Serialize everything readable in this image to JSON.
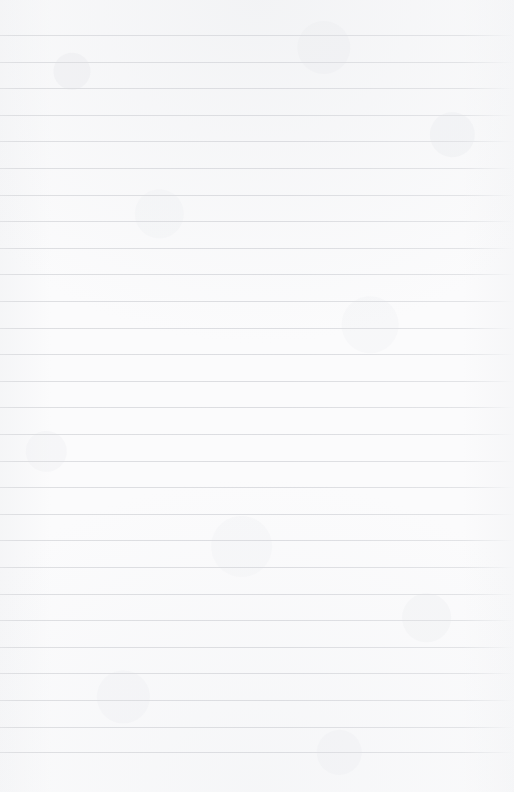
{
  "document": {
    "kind": "ruled-notebook-page",
    "title": "Blank ruled notebook page",
    "content_text": "",
    "written_text_present": "no",
    "page_width_px": 514,
    "page_height_px": 792
  },
  "paper": {
    "background_color": "#fbfbfc",
    "texture": "subtle mottled fibre grain",
    "margin_left_px": 0,
    "margin_right_px": 0,
    "top_margin_px": 35,
    "bottom_margin_px": 40
  },
  "ruling": {
    "style": "horizontal ruled lines",
    "line_color": "#dedfe2",
    "line_thickness_px": 1,
    "line_spacing_px": 26.6,
    "first_line_y_px": 35,
    "last_line_y_px": 752,
    "line_count": 28,
    "extends_full_width": "yes",
    "fades_at_right_edge": "yes",
    "vertical_margin_rule": "none",
    "line_positions_y": [
      35,
      61.6,
      88.2,
      114.8,
      141.4,
      168,
      194.6,
      221.2,
      247.8,
      274.4,
      301,
      327.6,
      354.2,
      380.8,
      407.4,
      434,
      460.6,
      487.2,
      513.8,
      540.4,
      567,
      593.6,
      620.2,
      646.8,
      673.4,
      700,
      726.6,
      752
    ]
  }
}
